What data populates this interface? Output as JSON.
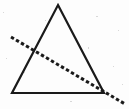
{
  "figure": {
    "type": "geometric-line-drawing",
    "canvas": {
      "width": 129,
      "height": 109
    },
    "background_color": "#fdfdfd",
    "ink_color": "#1a1a1a",
    "shapes": {
      "triangle": {
        "name": "triangle",
        "stroke_color": "#1a1a1a",
        "stroke_width": 2.2,
        "fill": "none",
        "style": "solid",
        "vertices": [
          {
            "label": "apex",
            "x": 58,
            "y": 5
          },
          {
            "label": "bottom-right",
            "x": 104,
            "y": 93
          },
          {
            "label": "bottom-left",
            "x": 12,
            "y": 93
          }
        ],
        "points_attr": "58,5 104,93 12,93"
      },
      "dashed_line": {
        "name": "dashed-transversal-line",
        "stroke_color": "#1a1a1a",
        "stroke_width": 3.0,
        "style": "dashed",
        "dash_pattern": "3.4 2.4",
        "linecap": "butt",
        "start": {
          "x": 11,
          "y": 37
        },
        "end": {
          "x": 125,
          "y": 104
        },
        "x1": 11,
        "y1": 37,
        "x2": 125,
        "y2": 104
      }
    },
    "intersections": [
      {
        "label": "left-edge-crossing",
        "x": 35,
        "y": 48
      },
      {
        "label": "bottom-right-vertex-crossing",
        "x": 104,
        "y": 93
      }
    ],
    "specks": [
      {
        "x": 3,
        "y": 12,
        "w": 1,
        "h": 1
      },
      {
        "x": 96,
        "y": 16,
        "w": 2,
        "h": 1
      },
      {
        "x": 118,
        "y": 30,
        "w": 1,
        "h": 1
      },
      {
        "x": 88,
        "y": 47,
        "w": 1,
        "h": 2
      },
      {
        "x": 24,
        "y": 72,
        "w": 1,
        "h": 1
      },
      {
        "x": 113,
        "y": 66,
        "w": 1,
        "h": 1
      },
      {
        "x": 6,
        "y": 58,
        "w": 1,
        "h": 1
      },
      {
        "x": 70,
        "y": 101,
        "w": 2,
        "h": 1
      },
      {
        "x": 45,
        "y": 20,
        "w": 1,
        "h": 1
      },
      {
        "x": 122,
        "y": 84,
        "w": 1,
        "h": 1
      }
    ]
  }
}
